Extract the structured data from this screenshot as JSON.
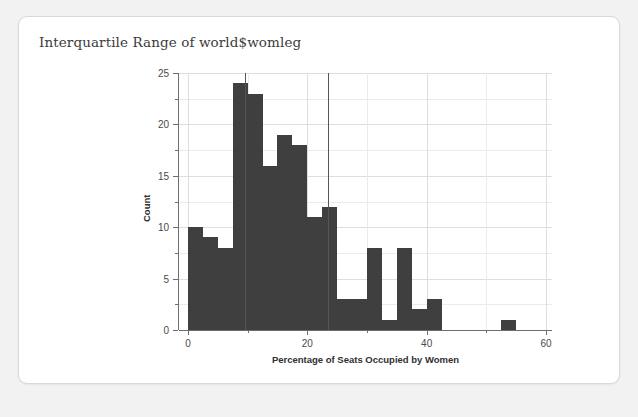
{
  "card": {
    "title": "Interquartile Range of world$womleg"
  },
  "chart_data": {
    "type": "bar",
    "subtype": "histogram",
    "title": "Interquartile Range of world$womleg",
    "xlabel": "Percentage of Seats Occupied by Women",
    "ylabel": "Count",
    "xlim": [
      -1.5,
      61
    ],
    "ylim": [
      0,
      25
    ],
    "grid": true,
    "legend": false,
    "bar_color": "#3f3f3f",
    "binwidth": 2.5,
    "x_ticks_major": [
      0,
      20,
      40,
      60
    ],
    "x_ticks_minor": [
      10,
      30,
      50
    ],
    "x_tick_labels": [
      "0",
      "20",
      "40",
      "60"
    ],
    "y_ticks_major": [
      0,
      5,
      10,
      15,
      20,
      25
    ],
    "y_ticks_minor": [
      2.5,
      7.5,
      12.5,
      17.5,
      22.5
    ],
    "y_tick_labels": [
      "0",
      "5",
      "10",
      "15",
      "20",
      "25"
    ],
    "bins": [
      {
        "x0": 0.0,
        "x1": 2.5,
        "count": 10
      },
      {
        "x0": 2.5,
        "x1": 5.0,
        "count": 9
      },
      {
        "x0": 5.0,
        "x1": 7.5,
        "count": 8
      },
      {
        "x0": 7.5,
        "x1": 10.0,
        "count": 24
      },
      {
        "x0": 10.0,
        "x1": 12.5,
        "count": 23
      },
      {
        "x0": 12.5,
        "x1": 15.0,
        "count": 16
      },
      {
        "x0": 15.0,
        "x1": 17.5,
        "count": 19
      },
      {
        "x0": 17.5,
        "x1": 20.0,
        "count": 18
      },
      {
        "x0": 20.0,
        "x1": 22.5,
        "count": 11
      },
      {
        "x0": 22.5,
        "x1": 25.0,
        "count": 12
      },
      {
        "x0": 25.0,
        "x1": 27.5,
        "count": 3
      },
      {
        "x0": 27.5,
        "x1": 30.0,
        "count": 3
      },
      {
        "x0": 30.0,
        "x1": 32.5,
        "count": 8
      },
      {
        "x0": 32.5,
        "x1": 35.0,
        "count": 1
      },
      {
        "x0": 35.0,
        "x1": 37.5,
        "count": 8
      },
      {
        "x0": 37.5,
        "x1": 40.0,
        "count": 2
      },
      {
        "x0": 40.0,
        "x1": 42.5,
        "count": 3
      },
      {
        "x0": 42.5,
        "x1": 45.0,
        "count": 0
      },
      {
        "x0": 45.0,
        "x1": 47.5,
        "count": 0
      },
      {
        "x0": 47.5,
        "x1": 50.0,
        "count": 0
      },
      {
        "x0": 50.0,
        "x1": 52.5,
        "count": 0
      },
      {
        "x0": 52.5,
        "x1": 55.0,
        "count": 1
      },
      {
        "x0": 55.0,
        "x1": 57.5,
        "count": 0
      }
    ],
    "annotations": [
      {
        "type": "vline",
        "name": "iqr-lower-line",
        "x": 9.5,
        "y_top": 25.0,
        "color": "#555555"
      },
      {
        "type": "vline",
        "name": "iqr-upper-line",
        "x": 23.4,
        "y_top": 25.0,
        "color": "#555555"
      }
    ]
  }
}
